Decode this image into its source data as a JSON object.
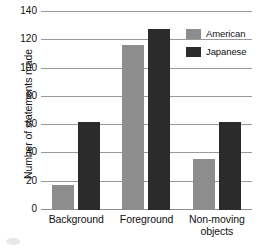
{
  "chart_data": {
    "type": "bar",
    "title": "",
    "xlabel": "",
    "ylabel": "Number of statements made",
    "categories": [
      "Background",
      "Foreground",
      "Non-moving objects"
    ],
    "category_lines": [
      [
        "Background"
      ],
      [
        "Foreground"
      ],
      [
        "Non-moving",
        "objects"
      ]
    ],
    "series": [
      {
        "name": "American",
        "color": "#8d8d8d",
        "values": [
          18,
          117,
          36
        ]
      },
      {
        "name": "Japanese",
        "color": "#2b2b2b",
        "values": [
          62,
          128,
          62
        ]
      }
    ],
    "ylim": [
      0,
      140
    ],
    "yticks": [
      0,
      20,
      40,
      60,
      80,
      100,
      120,
      140
    ],
    "ytick_labels": [
      "0",
      "20",
      "40",
      "60",
      "80",
      "100",
      "120",
      "140"
    ],
    "grid": true,
    "grid_axis": "y",
    "legend": {
      "position": "top-right",
      "entries": [
        {
          "label": "American",
          "color": "#8d8d8d"
        },
        {
          "label": "Japanese",
          "color": "#2b2b2b"
        }
      ]
    }
  }
}
